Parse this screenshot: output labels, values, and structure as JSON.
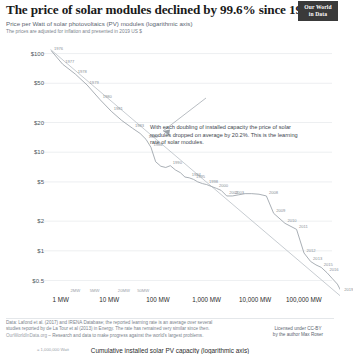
{
  "header": {
    "title": "The price of solar modules declined by 99.6% since 1976",
    "subtitle": "Price per Watt of solar photovoltaics (PV) modules (logarithmic axis)",
    "subtitle2": "The prices are adjusted for inflation and presented in 2019 US $",
    "logo_line1": "Our World",
    "logo_line2": "in Data"
  },
  "annotation": {
    "text": "With each doubling of installed capacity the price of solar modules dropped on average by 20.2%. This is the learning rate of solar modules."
  },
  "axes": {
    "x_title": "Cumulative installed solar PV capacity (logarithmic axis)",
    "x_note": "= 1,000,000 Watt"
  },
  "footer": {
    "source_line1": "Data: Lafond et al. (2017) and IRENA Database; the reported learning rate is an average over several",
    "source_line2": "studies reported by de La Tour et al (2013) in Energy. The rate has remained very similar since then.",
    "source_line3_link": "OurWorldInData.org",
    "source_line3_rest": " – Research and data to make progress against the world's largest problems.",
    "license_line1": "Licensed under CC-BY",
    "license_line2": "by the author Max Roser"
  },
  "chart_data": {
    "type": "line",
    "title": "The price of solar modules declined by 99.6% since 1976",
    "xlabel": "Cumulative installed solar PV capacity (logarithmic axis)",
    "ylabel": "Price per Watt of solar photovoltaics (PV) modules (logarithmic axis)",
    "xscale": "log",
    "yscale": "log",
    "xlim": [
      0.55,
      380000
    ],
    "ylim": [
      0.42,
      125
    ],
    "grid": true,
    "legend": "none",
    "y_ticks": [
      {
        "value": 100,
        "label": "$100"
      },
      {
        "value": 50,
        "label": "$50"
      },
      {
        "value": 20,
        "label": "$20"
      },
      {
        "value": 10,
        "label": "$10"
      },
      {
        "value": 5,
        "label": "$5"
      },
      {
        "value": 2,
        "label": "$2"
      },
      {
        "value": 1,
        "label": "$1"
      },
      {
        "value": 0.5,
        "label": "$0.5"
      }
    ],
    "x_ticks_major": [
      {
        "value": 1,
        "label": "1 MW"
      },
      {
        "value": 10,
        "label": "10 MW"
      },
      {
        "value": 100,
        "label": "100 MW"
      },
      {
        "value": 1000,
        "label": "1,000 MW"
      },
      {
        "value": 10000,
        "label": "10,000 MW"
      },
      {
        "value": 100000,
        "label": "100,000 MW"
      }
    ],
    "x_ticks_minor": [
      {
        "value": 2,
        "label": "2MW"
      },
      {
        "value": 5,
        "label": "5MW"
      },
      {
        "value": 20,
        "label": "20MW"
      },
      {
        "value": 50,
        "label": "50MW"
      }
    ],
    "series": [
      {
        "name": "Solar PV module price vs cumulative capacity",
        "points": [
          {
            "year": 1976,
            "capacity_mw": 0.65,
            "price_usd_per_watt": 106,
            "label": "1976"
          },
          {
            "year": 1977,
            "capacity_mw": 1.1,
            "price_usd_per_watt": 78,
            "label": "1977"
          },
          {
            "year": 1978,
            "capacity_mw": 2.0,
            "price_usd_per_watt": 62,
            "label": "1978"
          },
          {
            "year": 1979,
            "capacity_mw": 3.5,
            "price_usd_per_watt": 48,
            "label": "1979"
          },
          {
            "year": 1980,
            "capacity_mw": 6.5,
            "price_usd_per_watt": 34,
            "label": "1980"
          },
          {
            "year": 1981,
            "capacity_mw": 11,
            "price_usd_per_watt": 26,
            "label": "1981"
          },
          {
            "year": 1982,
            "capacity_mw": 18,
            "price_usd_per_watt": 21,
            "label": null
          },
          {
            "year": 1983,
            "capacity_mw": 30,
            "price_usd_per_watt": 17.5,
            "label": "1983"
          },
          {
            "year": 1984,
            "capacity_mw": 43,
            "price_usd_per_watt": 15.5,
            "label": null
          },
          {
            "year": 1985,
            "capacity_mw": 57,
            "price_usd_per_watt": 13.5,
            "label": "1985"
          },
          {
            "year": 1986,
            "capacity_mw": 72,
            "price_usd_per_watt": 11.2,
            "label": "1986"
          },
          {
            "year": 1987,
            "capacity_mw": 90,
            "price_usd_per_watt": 8.0,
            "label": null
          },
          {
            "year": 1988,
            "capacity_mw": 115,
            "price_usd_per_watt": 7.2,
            "label": null
          },
          {
            "year": 1989,
            "capacity_mw": 145,
            "price_usd_per_watt": 7.0,
            "label": null
          },
          {
            "year": 1990,
            "capacity_mw": 180,
            "price_usd_per_watt": 7.3,
            "label": "1990"
          },
          {
            "year": 1991,
            "capacity_mw": 230,
            "price_usd_per_watt": 6.6,
            "label": null
          },
          {
            "year": 1992,
            "capacity_mw": 290,
            "price_usd_per_watt": 6.2,
            "label": null
          },
          {
            "year": 1993,
            "capacity_mw": 360,
            "price_usd_per_watt": 5.6,
            "label": null
          },
          {
            "year": 1994,
            "capacity_mw": 440,
            "price_usd_per_watt": 5.5,
            "label": "1994"
          },
          {
            "year": 1995,
            "capacity_mw": 540,
            "price_usd_per_watt": 5.3,
            "label": "1995"
          },
          {
            "year": 1996,
            "capacity_mw": 660,
            "price_usd_per_watt": 5.0,
            "label": null
          },
          {
            "year": 1997,
            "capacity_mw": 830,
            "price_usd_per_watt": 4.8,
            "label": null
          },
          {
            "year": 1998,
            "capacity_mw": 1000,
            "price_usd_per_watt": 4.7,
            "label": "1998"
          },
          {
            "year": 1999,
            "capacity_mw": 1250,
            "price_usd_per_watt": 4.5,
            "label": null
          },
          {
            "year": 2000,
            "capacity_mw": 1600,
            "price_usd_per_watt": 4.3,
            "label": "2000"
          },
          {
            "year": 2001,
            "capacity_mw": 2000,
            "price_usd_per_watt": 4.1,
            "label": null
          },
          {
            "year": 2002,
            "capacity_mw": 2600,
            "price_usd_per_watt": 3.6,
            "label": "2002"
          },
          {
            "year": 2003,
            "capacity_mw": 3400,
            "price_usd_per_watt": 3.6,
            "label": "2003"
          },
          {
            "year": 2004,
            "capacity_mw": 4600,
            "price_usd_per_watt": 3.7,
            "label": null
          },
          {
            "year": 2005,
            "capacity_mw": 6200,
            "price_usd_per_watt": 3.8,
            "label": null
          },
          {
            "year": 2006,
            "capacity_mw": 8500,
            "price_usd_per_watt": 3.8,
            "label": null
          },
          {
            "year": 2007,
            "capacity_mw": 12000,
            "price_usd_per_watt": 3.75,
            "label": null
          },
          {
            "year": 2008,
            "capacity_mw": 17000,
            "price_usd_per_watt": 3.6,
            "label": "2008"
          },
          {
            "year": 2009,
            "capacity_mw": 24000,
            "price_usd_per_watt": 2.4,
            "label": "2009"
          },
          {
            "year": 2010,
            "capacity_mw": 41000,
            "price_usd_per_watt": 1.9,
            "label": "2010"
          },
          {
            "year": 2011,
            "capacity_mw": 71000,
            "price_usd_per_watt": 1.65,
            "label": "2011"
          },
          {
            "year": 2012,
            "capacity_mw": 101000,
            "price_usd_per_watt": 0.95,
            "label": "2012"
          },
          {
            "year": 2013,
            "capacity_mw": 138000,
            "price_usd_per_watt": 0.78,
            "label": "2013"
          },
          {
            "year": 2014,
            "capacity_mw": 178000,
            "price_usd_per_watt": 0.72,
            "label": null
          },
          {
            "year": 2015,
            "capacity_mw": 228000,
            "price_usd_per_watt": 0.68,
            "label": "2015"
          },
          {
            "year": 2016,
            "capacity_mw": 300000,
            "price_usd_per_watt": 0.6,
            "label": "2016"
          },
          {
            "year": 2017,
            "capacity_mw": 390000,
            "price_usd_per_watt": 0.52,
            "label": null
          },
          {
            "year": 2018,
            "capacity_mw": 490000,
            "price_usd_per_watt": 0.46,
            "label": null
          },
          {
            "year": 2019,
            "capacity_mw": 600000,
            "price_usd_per_watt": 0.38,
            "label": "2019"
          }
        ]
      },
      {
        "name": "Learning-rate trend line (20.2% per doubling)",
        "style": "straight",
        "points": [
          {
            "capacity_mw": 0.62,
            "price_usd_per_watt": 110
          },
          {
            "capacity_mw": 600000,
            "price_usd_per_watt": 0.34
          }
        ]
      }
    ]
  }
}
